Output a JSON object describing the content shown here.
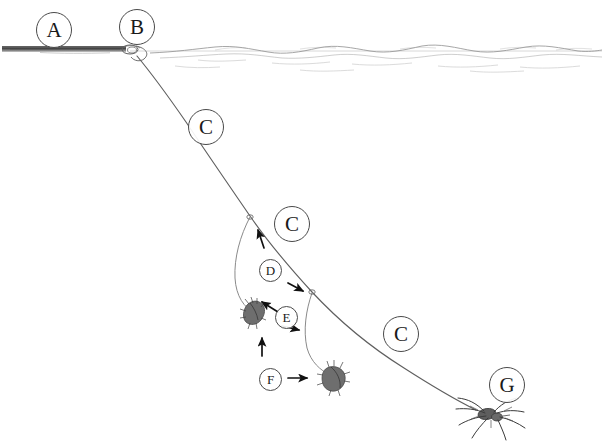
{
  "figure": {
    "background_color": "#ffffff",
    "ink_color": "#4a4a4a",
    "line_color": "#555555",
    "label_color": "#1a1a1a",
    "width": 602,
    "height": 445
  },
  "labels": [
    {
      "id": "A",
      "text": "A",
      "size": "big",
      "x": 36,
      "y": 12,
      "meaning": "anchor-stem-at-water-surface"
    },
    {
      "id": "B",
      "text": "B",
      "size": "big",
      "x": 119,
      "y": 9,
      "meaning": "silk-attachment-point"
    },
    {
      "id": "C1",
      "text": "C",
      "size": "big",
      "x": 188,
      "y": 109,
      "meaning": "drag-line-upper"
    },
    {
      "id": "C2",
      "text": "C",
      "size": "big",
      "x": 274,
      "y": 206,
      "meaning": "drag-line-middle"
    },
    {
      "id": "C3",
      "text": "C",
      "size": "big",
      "x": 383,
      "y": 316,
      "meaning": "drag-line-lower"
    },
    {
      "id": "D",
      "text": "D",
      "size": "small",
      "x": 259,
      "y": 259,
      "meaning": "silk-loop"
    },
    {
      "id": "E",
      "text": "E",
      "size": "small",
      "x": 275,
      "y": 306,
      "meaning": "prey-on-silk"
    },
    {
      "id": "F",
      "text": "F",
      "size": "small",
      "x": 259,
      "y": 368,
      "meaning": "water-current-direction"
    },
    {
      "id": "G",
      "text": "G",
      "size": "big",
      "x": 489,
      "y": 367,
      "meaning": "spider"
    }
  ],
  "elements": {
    "water_surface": "water-surface-line",
    "ripples": "water-surface-ripples",
    "stem": "horizontal-stem-anchor",
    "drag_line": "main-drag-line",
    "silk_loop": "silk-loop-thread",
    "secondary_thread": "secondary-silk-thread",
    "spider": "spider-body",
    "prey_upper": "prey-item-upper",
    "prey_lower": "prey-item-lower"
  },
  "arrows": [
    {
      "name": "arrow-up-loop",
      "x1": 264,
      "y1": 248,
      "x2": 258,
      "y2": 230,
      "meaning": "upward-silk-movement"
    },
    {
      "name": "arrow-right-loop",
      "x1": 288,
      "y1": 283,
      "x2": 304,
      "y2": 291,
      "meaning": "rightward-silk-movement"
    },
    {
      "name": "arrow-upleft-prey",
      "x1": 278,
      "y1": 312,
      "x2": 261,
      "y2": 301,
      "meaning": "prey-drawn-up-left"
    },
    {
      "name": "arrow-right-prey",
      "x1": 282,
      "y1": 326,
      "x2": 300,
      "y2": 330,
      "meaning": "prey-drawn-right"
    },
    {
      "name": "arrow-up-current",
      "x1": 262,
      "y1": 356,
      "x2": 262,
      "y2": 337,
      "meaning": "upward-current"
    },
    {
      "name": "arrow-right-current",
      "x1": 288,
      "y1": 378,
      "x2": 308,
      "y2": 378,
      "meaning": "rightward-current"
    }
  ]
}
